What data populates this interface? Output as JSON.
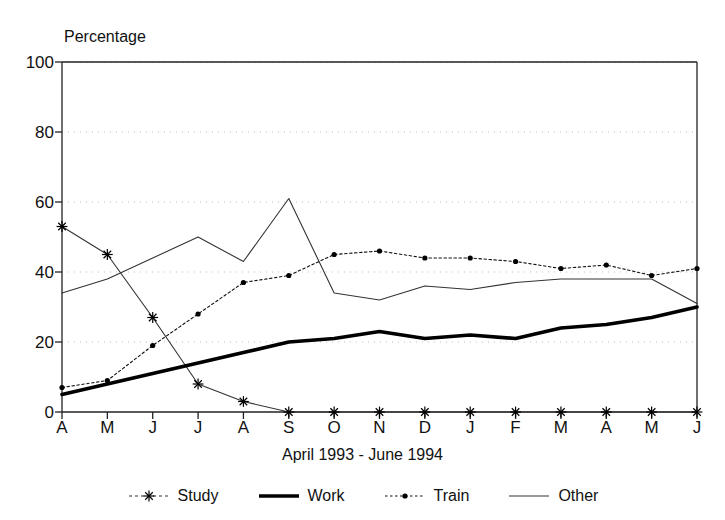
{
  "chart_data": {
    "type": "line",
    "title": "",
    "xlabel": "April 1993 - June 1994",
    "ylabel": "Percentage",
    "categories": [
      "A",
      "M",
      "J",
      "J",
      "A",
      "S",
      "O",
      "N",
      "D",
      "J",
      "F",
      "M",
      "A",
      "M",
      "J"
    ],
    "ylim": [
      0,
      100
    ],
    "ytick_labels": [
      "0",
      "20",
      "40",
      "60",
      "80",
      "100"
    ],
    "ytick_values": [
      0,
      20,
      40,
      60,
      80,
      100
    ],
    "grid": "horizontal-dotted",
    "legend_position": "bottom",
    "series": [
      {
        "name": "Study",
        "marker": "asterisk",
        "line": "thin",
        "values": [
          53,
          45,
          27,
          8,
          3,
          0,
          0,
          0,
          0,
          0,
          0,
          0,
          0,
          0,
          0
        ]
      },
      {
        "name": "Work",
        "marker": "none",
        "line": "thick",
        "values": [
          5,
          8,
          11,
          14,
          17,
          20,
          21,
          23,
          21,
          22,
          21,
          24,
          25,
          27,
          30
        ]
      },
      {
        "name": "Train",
        "marker": "dot",
        "line": "dotted",
        "values": [
          7,
          9,
          19,
          28,
          37,
          39,
          45,
          46,
          44,
          44,
          43,
          41,
          42,
          39,
          41
        ]
      },
      {
        "name": "Other",
        "marker": "none",
        "line": "thin",
        "values": [
          34,
          38,
          44,
          50,
          43,
          61,
          34,
          32,
          36,
          35,
          37,
          38,
          38,
          38,
          31
        ]
      }
    ]
  },
  "axes": {
    "y_title": "Percentage",
    "x_title": "April 1993 - June 1994"
  },
  "legend": {
    "items": [
      {
        "label": "Study",
        "icon": "asterisk-marker-icon"
      },
      {
        "label": "Work",
        "icon": "thick-line-icon"
      },
      {
        "label": "Train",
        "icon": "dotted-dot-marker-icon"
      },
      {
        "label": "Other",
        "icon": "thin-line-icon"
      }
    ]
  }
}
